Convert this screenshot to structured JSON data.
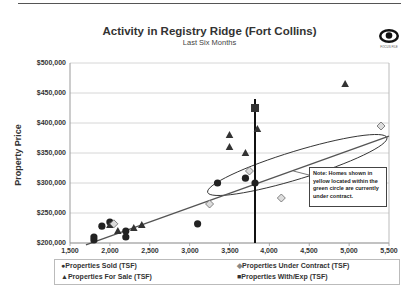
{
  "header": {
    "title": "Activity in Registry Ridge (Fort Collins)",
    "subtitle": "Last Six Months",
    "logo_icon": "eye-icon",
    "logo_text": "FOCUS FILE"
  },
  "note": "Note: Homes shown in yellow located within the green circle are currently under contract.",
  "legend": {
    "sold": "Properties Sold  (TSF)",
    "under_contract": "Properties Under Contract  (TSF)",
    "for_sale": "Properties For Sale  (TSF)",
    "with_exp": "Properties With/Exp  (TSF)"
  },
  "axes": {
    "ylabel": "Property Price",
    "yticks": [
      "$500,000",
      "$450,000",
      "$400,000",
      "$350,000",
      "$300,000",
      "$250,000",
      "$200,000"
    ],
    "xticks": [
      "1,500",
      "2,000",
      "2,500",
      "3,000",
      "3,500",
      "4,000",
      "4,500",
      "5,000",
      "5,500"
    ]
  },
  "chart_data": {
    "type": "scatter",
    "title": "Activity in Registry Ridge (Fort Collins)",
    "subtitle": "Last Six Months",
    "xlabel": "",
    "ylabel": "Property Price",
    "xlim": [
      1500,
      5500
    ],
    "ylim": [
      200000,
      500000
    ],
    "grid": "horizontal",
    "legend_position": "bottom",
    "series": [
      {
        "name": "Properties Sold  (TSF)",
        "marker": "circle",
        "points": [
          [
            1800,
            205000
          ],
          [
            1800,
            210000
          ],
          [
            1900,
            228000
          ],
          [
            2000,
            235000
          ],
          [
            2200,
            210000
          ],
          [
            2200,
            220000
          ],
          [
            3100,
            232000
          ],
          [
            3350,
            300000
          ],
          [
            3700,
            308000
          ],
          [
            3820,
            300000
          ]
        ]
      },
      {
        "name": "Properties For Sale  (TSF)",
        "marker": "triangle",
        "points": [
          [
            2000,
            230000
          ],
          [
            2100,
            220000
          ],
          [
            2300,
            225000
          ],
          [
            2400,
            230000
          ],
          [
            3500,
            380000
          ],
          [
            3500,
            360000
          ],
          [
            3700,
            350000
          ],
          [
            3850,
            390000
          ],
          [
            4950,
            465000
          ]
        ]
      },
      {
        "name": "Properties Under Contract  (TSF)",
        "marker": "diamond",
        "points": [
          [
            2050,
            232000
          ],
          [
            3250,
            265000
          ],
          [
            3750,
            320000
          ],
          [
            4150,
            275000
          ],
          [
            5400,
            395000
          ]
        ]
      },
      {
        "name": "Properties With/Exp  (TSF)",
        "marker": "square",
        "points": [
          [
            3820,
            425000
          ]
        ]
      }
    ],
    "trendline": {
      "from": [
        1700,
        197000
      ],
      "to": [
        5500,
        378000
      ]
    },
    "vertical_line_x": 3820,
    "annotations": [
      "Note: Homes shown in yellow located within the green circle are currently under contract."
    ]
  }
}
